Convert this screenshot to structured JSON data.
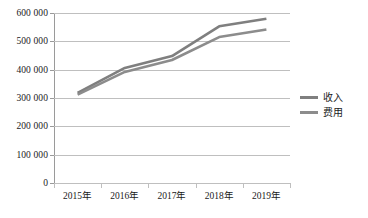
{
  "chart_data": {
    "type": "line",
    "title": "",
    "xlabel": "",
    "ylabel": "",
    "categories": [
      "2015年",
      "2016年",
      "2017年",
      "2018年",
      "2019年"
    ],
    "series": [
      {
        "name": "收入",
        "color": "#7f7f7f",
        "values": [
          318000,
          406000,
          448000,
          553000,
          580000
        ]
      },
      {
        "name": "费用",
        "color": "#8c8c8c",
        "values": [
          312000,
          392000,
          434000,
          515000,
          542000
        ]
      }
    ],
    "ylim": [
      0,
      600000
    ],
    "y_ticks": [
      0,
      100000,
      200000,
      300000,
      400000,
      500000,
      600000
    ],
    "y_tick_labels": [
      "0",
      "100 000",
      "200 000",
      "300 000",
      "400 000",
      "500 000",
      "600 000"
    ],
    "grid": true,
    "legend_position": "right",
    "gridline_color": "#bfbfbf",
    "axis_color": "#9a9a9a",
    "background": "#ffffff"
  },
  "legend": {
    "items": [
      {
        "label": "收入",
        "color": "#7f7f7f"
      },
      {
        "label": "费用",
        "color": "#8c8c8c"
      }
    ]
  }
}
